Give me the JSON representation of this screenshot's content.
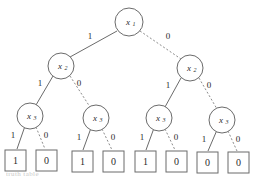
{
  "figure": {
    "type": "binary-decision-tree",
    "background_color": "#ffffff",
    "stroke_color": "#6b6b6b",
    "text_color": "#2b2b2b",
    "caption_fragment": "truth table"
  },
  "chart_data": {
    "type": "diagram",
    "title": "",
    "levels": [
      "x1",
      "x2",
      "x3"
    ],
    "nodes": [
      {
        "id": "n0",
        "label": "x",
        "sub": "1",
        "level": 0,
        "cx": 129,
        "cy": 22,
        "r": 14
      },
      {
        "id": "n1",
        "label": "x",
        "sub": "2",
        "level": 1,
        "cx": 61,
        "cy": 66,
        "r": 13
      },
      {
        "id": "n2",
        "label": "x",
        "sub": "2",
        "level": 1,
        "cx": 190,
        "cy": 68,
        "r": 13
      },
      {
        "id": "n3",
        "label": "x",
        "sub": "3",
        "level": 2,
        "cx": 30,
        "cy": 116,
        "r": 13
      },
      {
        "id": "n4",
        "label": "x",
        "sub": "3",
        "level": 2,
        "cx": 96,
        "cy": 118,
        "r": 13
      },
      {
        "id": "n5",
        "label": "x",
        "sub": "3",
        "level": 2,
        "cx": 159,
        "cy": 118,
        "r": 13
      },
      {
        "id": "n6",
        "label": "x",
        "sub": "3",
        "level": 2,
        "cx": 222,
        "cy": 120,
        "r": 13
      }
    ],
    "leaves": [
      {
        "id": "l0",
        "value": "1",
        "x": 5,
        "y": 150,
        "w": 21,
        "h": 21
      },
      {
        "id": "l1",
        "value": "0",
        "x": 36,
        "y": 150,
        "w": 21,
        "h": 21
      },
      {
        "id": "l2",
        "value": "1",
        "x": 72,
        "y": 151,
        "w": 21,
        "h": 21
      },
      {
        "id": "l3",
        "value": "0",
        "x": 103,
        "y": 151,
        "w": 21,
        "h": 21
      },
      {
        "id": "l4",
        "value": "1",
        "x": 135,
        "y": 151,
        "w": 21,
        "h": 21
      },
      {
        "id": "l5",
        "value": "0",
        "x": 166,
        "y": 151,
        "w": 21,
        "h": 21
      },
      {
        "id": "l6",
        "value": "0",
        "x": 197,
        "y": 152,
        "w": 21,
        "h": 21
      },
      {
        "id": "l7",
        "value": "0",
        "x": 228,
        "y": 152,
        "w": 21,
        "h": 21
      }
    ],
    "edges": [
      {
        "id": "e0",
        "from": "n0",
        "to": "n1",
        "value": "1",
        "style": "solid",
        "x1": 117,
        "y1": 31,
        "x2": 70,
        "y2": 57,
        "lx": 90,
        "ly": 36
      },
      {
        "id": "e1",
        "from": "n0",
        "to": "n2",
        "value": "0",
        "style": "dashed",
        "x1": 140,
        "y1": 31,
        "x2": 181,
        "y2": 59,
        "lx": 168,
        "ly": 36
      },
      {
        "id": "e2",
        "from": "n1",
        "to": "n3",
        "value": "1",
        "style": "solid",
        "x1": 53,
        "y1": 76,
        "x2": 36,
        "y2": 105,
        "lx": 40,
        "ly": 83
      },
      {
        "id": "e3",
        "from": "n1",
        "to": "n4",
        "value": "0",
        "style": "dashed",
        "x1": 70,
        "y1": 76,
        "x2": 90,
        "y2": 107,
        "lx": 79,
        "ly": 83
      },
      {
        "id": "e4",
        "from": "n2",
        "to": "n5",
        "value": "1",
        "style": "solid",
        "x1": 181,
        "y1": 78,
        "x2": 165,
        "y2": 107,
        "lx": 168,
        "ly": 85
      },
      {
        "id": "e5",
        "from": "n2",
        "to": "n6",
        "value": "0",
        "style": "dashed",
        "x1": 199,
        "y1": 78,
        "x2": 217,
        "y2": 109,
        "lx": 209,
        "ly": 85
      },
      {
        "id": "e6",
        "from": "n3",
        "to": "l0",
        "value": "1",
        "style": "solid",
        "x1": 25,
        "y1": 126,
        "x2": 17,
        "y2": 149,
        "lx": 13,
        "ly": 135
      },
      {
        "id": "e7",
        "from": "n3",
        "to": "l1",
        "value": "0",
        "style": "dashed",
        "x1": 36,
        "y1": 127,
        "x2": 45,
        "y2": 149,
        "lx": 46,
        "ly": 135
      },
      {
        "id": "e8",
        "from": "n4",
        "to": "l2",
        "value": "1",
        "style": "solid",
        "x1": 91,
        "y1": 128,
        "x2": 83,
        "y2": 150,
        "lx": 79,
        "ly": 137
      },
      {
        "id": "e9",
        "from": "n4",
        "to": "l3",
        "value": "0",
        "style": "dashed",
        "x1": 102,
        "y1": 129,
        "x2": 112,
        "y2": 150,
        "lx": 113,
        "ly": 137
      },
      {
        "id": "e10",
        "from": "n5",
        "to": "l4",
        "value": "1",
        "style": "solid",
        "x1": 154,
        "y1": 128,
        "x2": 146,
        "y2": 150,
        "lx": 142,
        "ly": 137
      },
      {
        "id": "e11",
        "from": "n5",
        "to": "l5",
        "value": "0",
        "style": "dashed",
        "x1": 165,
        "y1": 129,
        "x2": 175,
        "y2": 150,
        "lx": 176,
        "ly": 137
      },
      {
        "id": "e12",
        "from": "n6",
        "to": "l6",
        "value": "1",
        "style": "solid",
        "x1": 217,
        "y1": 130,
        "x2": 208,
        "y2": 151,
        "lx": 204,
        "ly": 139
      },
      {
        "id": "e13",
        "from": "n6",
        "to": "l7",
        "value": "0",
        "style": "dashed",
        "x1": 228,
        "y1": 131,
        "x2": 237,
        "y2": 151,
        "lx": 238,
        "ly": 139
      }
    ]
  }
}
